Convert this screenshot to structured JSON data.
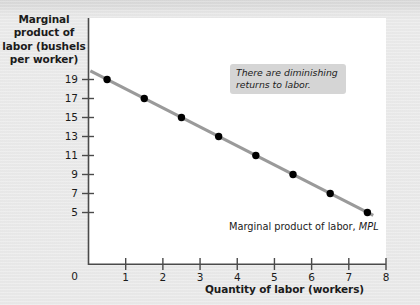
{
  "chart_data": {
    "type": "line",
    "title": "",
    "xlabel": "Quantity of labor (workers)",
    "ylabel": "Marginal product of labor (bushels per worker)",
    "xlim": [
      0,
      8
    ],
    "ylim": [
      0,
      20
    ],
    "grid": false,
    "xticks": [
      "0",
      "1",
      "2",
      "3",
      "4",
      "5",
      "6",
      "7",
      "8"
    ],
    "xtick_values": [
      0,
      1,
      2,
      3,
      4,
      5,
      6,
      7,
      8
    ],
    "yticks": [
      "5",
      "7",
      "9",
      "11",
      "13",
      "15",
      "17",
      "19"
    ],
    "ytick_values": [
      5,
      7,
      9,
      11,
      13,
      15,
      17,
      19
    ],
    "y_origin_label": "0",
    "series": [
      {
        "name": "Marginal product of labor, MPL",
        "color": "#9a9a9a",
        "marker_color": "#000000",
        "x": [
          0.5,
          1.5,
          2.5,
          3.5,
          4.5,
          5.5,
          6.5,
          7.5
        ],
        "values": [
          19,
          17,
          15,
          13,
          11,
          9,
          7,
          5
        ]
      }
    ],
    "series_label_text": "Marginal product of labor, ",
    "series_label_symbol": "MPL",
    "annotations": [
      {
        "text": "There are diminishing returns to labor.",
        "style": "callout",
        "background": "#d5d5d5"
      }
    ],
    "legend": "none",
    "colors": {
      "plot_background": "#ffffff",
      "page_background": "#e9e9e9",
      "axis": "#4a4a4a",
      "text": "#1b1b1b",
      "line": "#9a9a9a",
      "marker": "#000000"
    }
  }
}
